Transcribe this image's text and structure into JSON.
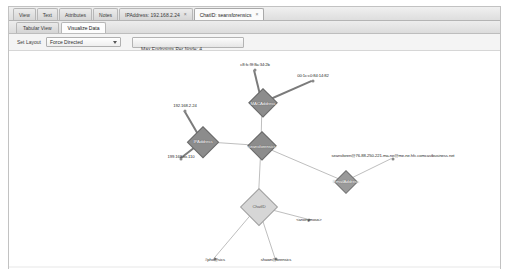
{
  "window": {
    "title": "Graph Visualization"
  },
  "tabs": [
    {
      "label": "View",
      "closable": false,
      "active": false
    },
    {
      "label": "Text",
      "closable": false,
      "active": false
    },
    {
      "label": "Attributes",
      "closable": false,
      "active": false
    },
    {
      "label": "Notes",
      "closable": false,
      "active": false
    },
    {
      "label": "IPAddress: 192.168.2.24",
      "closable": true,
      "close_glyph": "×",
      "active": false
    },
    {
      "label": "ChatID: seansforensics",
      "closable": true,
      "close_glyph": "×",
      "active": true
    }
  ],
  "subtabs": [
    {
      "label": "Tabular View",
      "active": false
    },
    {
      "label": "Visualize Data",
      "active": true
    }
  ],
  "toolbar": {
    "layout_label": "Set Layout",
    "layout_value": "Force Directed",
    "layout_options": [
      "Force Directed"
    ],
    "chevron_icon": "chevron-down-icon",
    "endpoints_caption": "Max Endpoints Per Node:  4",
    "endpoints_value": "4"
  },
  "graph": {
    "colors": {
      "node_dark": "#8c8c8c",
      "node_mid": "#9a9a9a",
      "node_light": "#d6d6d6",
      "edge": "#7b7b7b",
      "endpoint": "#8a8a8a"
    },
    "nodes": [
      {
        "id": "macaddress",
        "label": "MACAddress",
        "x": 262,
        "y": 101,
        "size": 30,
        "tone": "dark"
      },
      {
        "id": "ipaddress",
        "label": "IPAddress",
        "x": 202,
        "y": 140,
        "size": 32,
        "tone": "dark"
      },
      {
        "id": "seansforensics",
        "label": "seansforensics",
        "x": 261,
        "y": 144,
        "size": 30,
        "tone": "dark"
      },
      {
        "id": "emailaddress",
        "label": "EmailAddress",
        "x": 345,
        "y": 180,
        "size": 24,
        "tone": "mid"
      },
      {
        "id": "chatid",
        "label": "ChatID",
        "x": 258,
        "y": 205,
        "size": 38,
        "tone": "light"
      }
    ],
    "endpoints": [
      {
        "id": "mac1",
        "label": "c8:fc:9f:8a:34:2b",
        "x": 254,
        "y": 62,
        "dot_x": 254,
        "dot_y": 68,
        "parent": "macaddress"
      },
      {
        "id": "mac2",
        "label": "00:1c:c0:84:14:82",
        "x": 312,
        "y": 73,
        "dot_x": 312,
        "dot_y": 79,
        "parent": "macaddress"
      },
      {
        "id": "ip1",
        "label": "192.168.2.24",
        "x": 184,
        "y": 103,
        "dot_x": 184,
        "dot_y": 109,
        "parent": "ipaddress"
      },
      {
        "id": "ip2",
        "label": "199.168.xx.110",
        "x": 180,
        "y": 154,
        "dot_x": 180,
        "dot_y": 157,
        "parent": "ipaddress"
      },
      {
        "id": "email1",
        "label": "seansforen@76-88-250-221-ma-ne@me-ne.hfc.comcastbusiness.net",
        "x": 392,
        "y": 153,
        "dot_x": 392,
        "dot_y": 157,
        "parent": "emailaddress"
      },
      {
        "id": "chat1",
        "label": "<anonymous>",
        "x": 308,
        "y": 217,
        "dot_x": 308,
        "dot_y": 218,
        "parent": "chatid"
      },
      {
        "id": "chat2",
        "label": "#pho@sics",
        "x": 214,
        "y": 257,
        "dot_x": 214,
        "dot_y": 257,
        "parent": "chatid"
      },
      {
        "id": "chat3",
        "label": "shawn@orensics",
        "x": 275,
        "y": 257,
        "dot_x": 275,
        "dot_y": 257,
        "parent": "chatid"
      }
    ],
    "edges": [
      {
        "from": "mac1",
        "to": "macaddress",
        "weight": "thick"
      },
      {
        "from": "mac2",
        "to": "macaddress",
        "weight": "thick"
      },
      {
        "from": "ip1",
        "to": "ipaddress",
        "weight": "thick"
      },
      {
        "from": "ip2",
        "to": "ipaddress",
        "weight": "thick"
      },
      {
        "from": "ipaddress",
        "to": "seansforensics",
        "weight": "thin"
      },
      {
        "from": "macaddress",
        "to": "seansforensics",
        "weight": "thin"
      },
      {
        "from": "seansforensics",
        "to": "emailaddress",
        "weight": "thin"
      },
      {
        "from": "emailaddress",
        "to": "email1",
        "weight": "thin"
      },
      {
        "from": "seansforensics",
        "to": "chatid",
        "weight": "thin"
      },
      {
        "from": "chatid",
        "to": "chat1",
        "weight": "thin"
      },
      {
        "from": "chatid",
        "to": "chat2",
        "weight": "thin"
      },
      {
        "from": "chatid",
        "to": "chat3",
        "weight": "thin"
      }
    ]
  }
}
